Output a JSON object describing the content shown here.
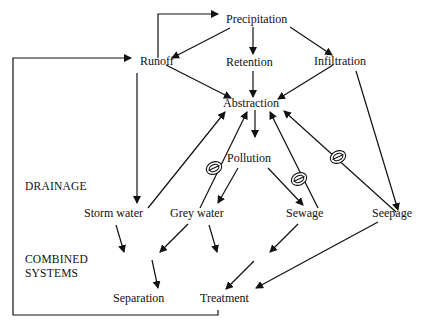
{
  "diagram": {
    "nodes": {
      "precipitation": "Precipitation",
      "runoff": "Runoff",
      "retention": "Retention",
      "infiltration": "Infiltration",
      "abstraction": "Abstraction",
      "pollution": "Pollution",
      "storm_water": "Storm water",
      "grey_water": "Grey water",
      "sewage": "Sewage",
      "seepage": "Seepage",
      "separation": "Separation",
      "treatment": "Treatment"
    },
    "section_labels": {
      "drainage": "DRAINAGE",
      "combined_line1": "COMBINED",
      "combined_line2": "SYSTEMS"
    },
    "edges": [
      {
        "from": "Runoff",
        "to": "Precipitation",
        "style": "elbow"
      },
      {
        "from": "Precipitation",
        "to": "Runoff"
      },
      {
        "from": "Precipitation",
        "to": "Retention"
      },
      {
        "from": "Precipitation",
        "to": "Infiltration"
      },
      {
        "from": "Runoff",
        "to": "Abstraction"
      },
      {
        "from": "Retention",
        "to": "Abstraction"
      },
      {
        "from": "Infiltration",
        "to": "Abstraction"
      },
      {
        "from": "Infiltration",
        "to": "Seepage"
      },
      {
        "from": "Runoff",
        "to": "Storm water"
      },
      {
        "from": "Abstraction",
        "to": "Pollution"
      },
      {
        "from": "Storm water",
        "to": "Abstraction"
      },
      {
        "from": "Grey water",
        "to": "Abstraction",
        "prohibited": true
      },
      {
        "from": "Sewage",
        "to": "Abstraction",
        "prohibited": true
      },
      {
        "from": "Seepage",
        "to": "Abstraction",
        "prohibited": true
      },
      {
        "from": "Pollution",
        "to": "Grey water"
      },
      {
        "from": "Pollution",
        "to": "Sewage"
      },
      {
        "from": "Storm water",
        "to": "Separation"
      },
      {
        "from": "Grey water",
        "to": "Separation"
      },
      {
        "from": "Grey water",
        "to": "Treatment"
      },
      {
        "from": "Sewage",
        "to": "Treatment"
      },
      {
        "from": "Separation",
        "to": "Treatment"
      },
      {
        "from": "Seepage",
        "to": "Treatment"
      },
      {
        "from": "Treatment",
        "to": "Runoff",
        "style": "feedback-loop"
      }
    ],
    "prohibited_symbol": "no-entry-sign"
  }
}
